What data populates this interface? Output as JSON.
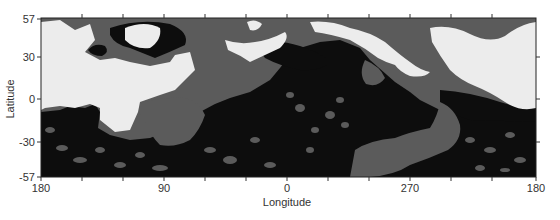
{
  "map": {
    "xlabel": "Longitude",
    "ylabel": "Latitude",
    "x_ticks": [
      "180",
      "90",
      "0",
      "270",
      "180"
    ],
    "y_ticks": [
      "57",
      "30",
      "0",
      "-30",
      "-57"
    ],
    "x_range": [
      180,
      180
    ],
    "y_range": [
      -57,
      57
    ],
    "legend": [],
    "colors": {
      "light_unit": "#ececec",
      "medium_unit": "#5b5b5b",
      "dark_unit": "#0d0d0d",
      "frame": "#222222"
    }
  }
}
